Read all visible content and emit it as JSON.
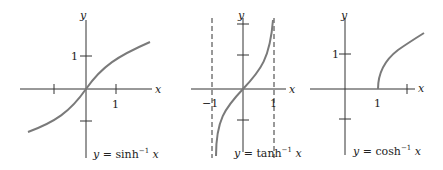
{
  "graphs": [
    {
      "id": "sinh",
      "caption_y": "y",
      "caption_eq": " = sinh",
      "caption_exp": "−1",
      "caption_x": " x",
      "axis_x": "x",
      "axis_y": "y",
      "tick_x1": "1",
      "tick_y1": "1"
    },
    {
      "id": "tanh",
      "caption_y": "y",
      "caption_eq": " = tanh",
      "caption_exp": "−1",
      "caption_x": " x",
      "axis_x": "x",
      "axis_y": "y",
      "tick_xm1": "−1",
      "tick_x1": "1"
    },
    {
      "id": "cosh",
      "caption_y": "y",
      "caption_eq": " = cosh",
      "caption_exp": "−1",
      "caption_x": " x",
      "axis_x": "x",
      "axis_y": "y",
      "tick_x1": "1",
      "tick_y1": "1"
    }
  ],
  "colors": {
    "axis": "#333333",
    "curve": "#7a7a7a"
  }
}
